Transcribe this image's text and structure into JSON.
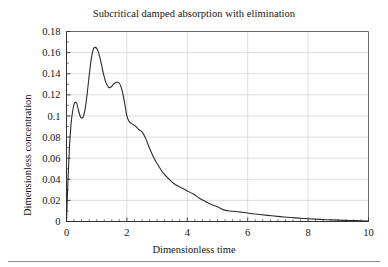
{
  "chart_data": {
    "type": "line",
    "title": "Subcritical damped absorption with elimination",
    "xlabel": "Dimensionless time",
    "ylabel": "Dimensionless concentration",
    "xlim": [
      0,
      10
    ],
    "ylim": [
      0,
      0.18
    ],
    "grid": true,
    "legend": null,
    "xticks": [
      0,
      2,
      4,
      6,
      8,
      10
    ],
    "xticklabels": [
      "0",
      "2",
      "4",
      "6",
      "8",
      "10"
    ],
    "xminortick_step": 0.25,
    "yticks": [
      0,
      0.02,
      0.04,
      0.06,
      0.08,
      0.1,
      0.12,
      0.14,
      0.16,
      0.18
    ],
    "yticklabels": [
      "0",
      "0.02",
      "0.04",
      "0.06",
      "0.08",
      "0.1",
      "0.12",
      "0.14",
      "0.16",
      "0.18"
    ],
    "yminortick_step": 0.01,
    "line_color": "#2b2b2b",
    "grid_color": "#c8c8c8",
    "axis_color": "#555555",
    "series": [
      {
        "name": "concentration",
        "x": [
          0.0,
          0.05,
          0.1,
          0.15,
          0.2,
          0.25,
          0.3,
          0.35,
          0.4,
          0.45,
          0.5,
          0.55,
          0.6,
          0.65,
          0.7,
          0.75,
          0.8,
          0.85,
          0.9,
          0.95,
          1.0,
          1.05,
          1.1,
          1.15,
          1.2,
          1.25,
          1.3,
          1.35,
          1.4,
          1.45,
          1.5,
          1.55,
          1.6,
          1.65,
          1.7,
          1.75,
          1.8,
          1.85,
          1.9,
          1.95,
          2.0,
          2.05,
          2.1,
          2.15,
          2.2,
          2.3,
          2.4,
          2.5,
          2.6,
          2.7,
          2.8,
          2.9,
          3.0,
          3.2,
          3.4,
          3.6,
          3.8,
          4.0,
          4.2,
          4.4,
          4.6,
          4.8,
          5.0,
          5.2,
          5.4,
          5.6,
          5.8,
          6.0,
          6.4,
          6.8,
          7.2,
          7.6,
          8.0,
          8.4,
          8.8,
          9.2,
          9.6,
          10.0
        ],
        "y": [
          0.0,
          0.04,
          0.072,
          0.092,
          0.104,
          0.111,
          0.113,
          0.111,
          0.105,
          0.1,
          0.098,
          0.099,
          0.104,
          0.113,
          0.125,
          0.138,
          0.15,
          0.159,
          0.164,
          0.165,
          0.164,
          0.161,
          0.156,
          0.15,
          0.143,
          0.137,
          0.132,
          0.129,
          0.127,
          0.127,
          0.128,
          0.13,
          0.131,
          0.132,
          0.132,
          0.131,
          0.128,
          0.123,
          0.116,
          0.108,
          0.1,
          0.096,
          0.094,
          0.093,
          0.092,
          0.09,
          0.087,
          0.085,
          0.08,
          0.073,
          0.066,
          0.06,
          0.055,
          0.046,
          0.04,
          0.035,
          0.032,
          0.029,
          0.026,
          0.022,
          0.019,
          0.016,
          0.014,
          0.011,
          0.01,
          0.0095,
          0.0088,
          0.008,
          0.0066,
          0.0054,
          0.0043,
          0.0034,
          0.0026,
          0.002,
          0.0015,
          0.0011,
          0.0008,
          0.0005
        ]
      }
    ]
  }
}
